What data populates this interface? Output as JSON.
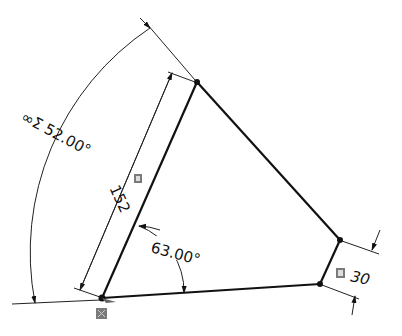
{
  "sketch": {
    "dimensions": {
      "arc_angle": {
        "prefix": "∞Σ",
        "value": "52.00°"
      },
      "length": {
        "value": "152"
      },
      "inner_angle": {
        "value": "63.00°"
      },
      "short_side": {
        "value": "30"
      }
    },
    "colors": {
      "line": "#111111",
      "badge": "#7a7a7a"
    }
  }
}
